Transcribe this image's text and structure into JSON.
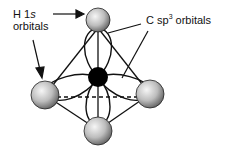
{
  "diagram": {
    "labels": {
      "h_orbitals_line1": "H 1",
      "h_orbitals_italic": "s",
      "h_orbitals_line2": "orbitals",
      "c_orbitals_prefix": "C sp",
      "c_orbitals_sup": "3",
      "c_orbitals_suffix": " orbitals"
    },
    "atoms": [
      {
        "name": "H",
        "position": "top"
      },
      {
        "name": "H",
        "position": "left"
      },
      {
        "name": "H",
        "position": "right"
      },
      {
        "name": "H",
        "position": "bottom"
      },
      {
        "name": "C",
        "position": "center"
      }
    ],
    "colors": {
      "carbon": "#000000",
      "hydrogen_light": "#f4f4f4",
      "hydrogen_dark": "#6a6a6a",
      "lines": "#111111"
    }
  }
}
